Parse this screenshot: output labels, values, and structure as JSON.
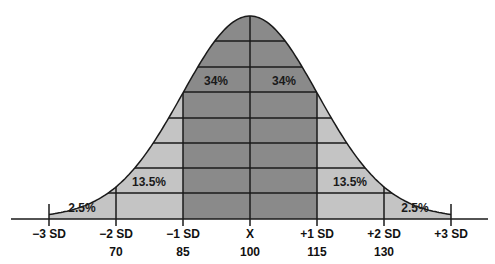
{
  "chart_data": {
    "type": "area",
    "title": "",
    "xlabel": "",
    "ylabel": "",
    "x_ticks": [
      {
        "label": "−3 SD",
        "value": ""
      },
      {
        "label": "−2 SD",
        "value": "70"
      },
      {
        "label": "−1 SD",
        "value": "85"
      },
      {
        "label": "X",
        "value": "100"
      },
      {
        "label": "+1 SD",
        "value": "115"
      },
      {
        "label": "+2 SD",
        "value": "130"
      },
      {
        "label": "+3 SD",
        "value": ""
      }
    ],
    "regions": [
      {
        "range": "-3 SD to -2 SD",
        "label": "2.5%",
        "value": 2.5
      },
      {
        "range": "-2 SD to -1 SD",
        "label": "13.5%",
        "value": 13.5
      },
      {
        "range": "-1 SD to mean",
        "label": "34%",
        "value": 34
      },
      {
        "range": "mean to +1 SD",
        "label": "34%",
        "value": 34
      },
      {
        "range": "+1 SD to +2 SD",
        "label": "13.5%",
        "value": 13.5
      },
      {
        "range": "+2 SD to +3 SD",
        "label": "2.5%",
        "value": 2.5
      }
    ],
    "mean": 100,
    "sd": 15,
    "grid": true,
    "legend": null
  },
  "colors": {
    "inner": "#8a8a8a",
    "outer": "#c4c4c4",
    "line": "#1a1a1a"
  }
}
